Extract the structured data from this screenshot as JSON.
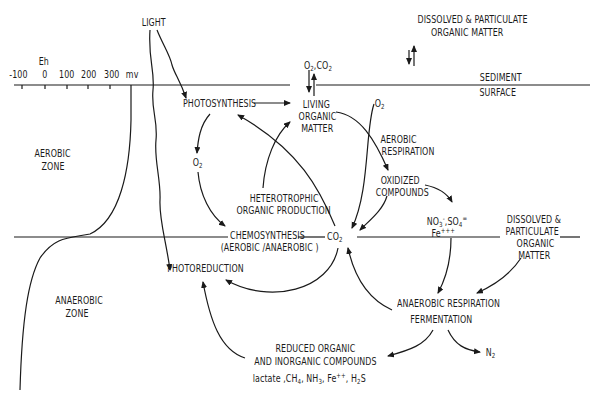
{
  "diagram": {
    "axis": {
      "label": "Eh",
      "ticks": [
        "-100",
        "0",
        "100",
        "200",
        "300"
      ],
      "unit": "mv"
    },
    "surface_label": [
      "SEDIMENT",
      "SURFACE"
    ],
    "zones": {
      "aerobic": [
        "AEROBIC",
        "ZONE"
      ],
      "anaerobic": [
        "ANAEROBIC",
        "ZONE"
      ]
    },
    "nodes": {
      "light": "LIGHT",
      "dissolved_top": [
        "DISSOLVED & PARTICULATE",
        "ORGANIC MATTER"
      ],
      "o2_co2_exchange": "O2,CO2",
      "photosynthesis": "PHOTOSYNTHESIS",
      "living_organic_matter": [
        "LIVING",
        "ORGANIC",
        "MATTER"
      ],
      "o2_top": "O2",
      "aerobic_respiration": [
        "AEROBIC",
        "RESPIRATION"
      ],
      "o2_left": "O2",
      "oxidized_compounds": [
        "OXIDIZED",
        "COMPOUNDS"
      ],
      "heterotrophic": [
        "HETEROTROPHIC",
        "ORGANIC PRODUCTION"
      ],
      "nitrate_sulfate": "NO3-,SO4=",
      "ferric": "Fe+++",
      "chemosynthesis": [
        "CHEMOSYNTHESIS",
        "(AEROBIC /ANAEROBIC )"
      ],
      "co2": "CO2",
      "dissolved_right": [
        "DISSOLVED &",
        "PARTICULATE",
        "ORGANIC",
        "MATTER"
      ],
      "photoreduction": "PHOTOREDUCTION",
      "anaerobic_respiration": [
        "ANAEROBIC  RESPIRATION",
        "FERMENTATION"
      ],
      "reduced_compounds": [
        "REDUCED ORGANIC",
        "AND INORGANIC COMPOUNDS",
        "lactate ,CH4, NH3, Fe++, H2S"
      ],
      "n2": "N2"
    }
  }
}
